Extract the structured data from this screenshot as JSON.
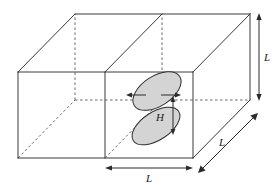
{
  "figure": {
    "type": "geometry-diagram",
    "background_color": "#ffffff",
    "line_color": "#3a3a3a",
    "hidden_line_color": "#6b6b6b",
    "blob_fill_color": "#d4d4d4",
    "blob_stroke_color": "#2e2e2e",
    "labels": {
      "height_dimension": "H",
      "depth_dimension": "L",
      "width_dimension": "L",
      "vertical_dimension": "L"
    },
    "box": {
      "front_bottom_left": [
        18,
        158
      ],
      "front_bottom_mid": [
        105,
        158
      ],
      "front_bottom_right": [
        193,
        158
      ],
      "front_top_left": [
        18,
        72
      ],
      "front_top_mid": [
        105,
        72
      ],
      "front_top_right": [
        193,
        72
      ],
      "back_bottom_left": [
        75,
        100
      ],
      "back_bottom_mid": [
        162,
        100
      ],
      "back_bottom_right": [
        250,
        100
      ],
      "back_top_left": [
        75,
        14
      ],
      "back_top_mid": [
        162,
        14
      ],
      "back_top_right": [
        250,
        14
      ]
    },
    "blobs": [
      {
        "name": "upper-blob",
        "center": [
          157,
          91
        ],
        "rx": 27,
        "ry": 15,
        "rotation_deg": -33
      },
      {
        "name": "lower-blob",
        "center": [
          156,
          126
        ],
        "rx": 27,
        "ry": 14,
        "rotation_deg": -33
      }
    ],
    "arrows": {
      "left_spread": {
        "from": [
          146,
          95
        ],
        "to": [
          127,
          95
        ],
        "direction": "left"
      },
      "right_spread": {
        "from": [
          160,
          95
        ],
        "to": [
          180,
          95
        ],
        "direction": "right"
      },
      "height_arrow": {
        "from": [
          173,
          97
        ],
        "to": [
          173,
          134
        ],
        "style": "double-headed"
      }
    }
  }
}
